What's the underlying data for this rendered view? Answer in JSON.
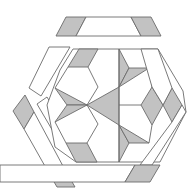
{
  "figure": {
    "title": "Hexagonal geometric tiling pattern",
    "colors": {
      "shaded": "#c2c2c2",
      "unshaded": "#ffffff",
      "stroke": "#6b6b6b",
      "background": "#ffffff"
    },
    "bands": [
      {
        "id": "top-band",
        "label": "top band"
      },
      {
        "id": "upper-left-band",
        "label": "upper-left band"
      },
      {
        "id": "lower-left-band",
        "label": "lower-left band"
      },
      {
        "id": "bottom-band",
        "label": "bottom band"
      },
      {
        "id": "right-band",
        "label": "right band"
      }
    ],
    "center_label": "central six-point star"
  }
}
